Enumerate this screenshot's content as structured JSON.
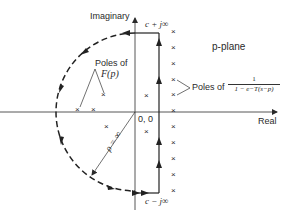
{
  "diagram": {
    "plane_label": "p-plane",
    "axes": {
      "vertical_label": "Imaginary",
      "horizontal_label": "Real",
      "origin_label": "0, 0"
    },
    "contour": {
      "top_label": "c + j∞",
      "bottom_label": "c − j∞",
      "radius_label": "ρ = ∞"
    },
    "annotations": {
      "poles_F_line1": "Poles of",
      "poles_F_line2": "F(p)",
      "poles_periodic_prefix": "Poles of",
      "poles_periodic_numerator": "1",
      "poles_periodic_denominator": "1 − e−T(s−p)"
    },
    "pole_marker": "×",
    "colors": {
      "ink": "#2a2a2a",
      "background": "#ffffff"
    }
  }
}
